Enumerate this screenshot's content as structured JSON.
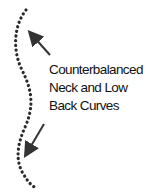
{
  "diagram": {
    "label_lines": [
      "Counterbalanced",
      "Neck and Low",
      "Back Curves"
    ],
    "colors": {
      "spine": "#2a2a2a",
      "arrow": "#333333",
      "text": "#111111"
    },
    "elements": [
      {
        "type": "dotted-curve",
        "name": "spine-curve"
      },
      {
        "type": "arrow",
        "name": "neck-arrow",
        "direction": "up-left"
      },
      {
        "type": "arrow",
        "name": "low-back-arrow",
        "direction": "down-left"
      }
    ]
  }
}
